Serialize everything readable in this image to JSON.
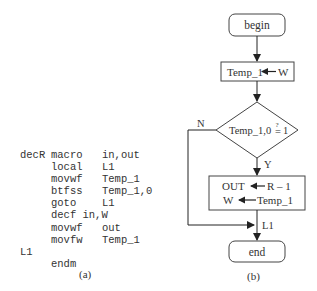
{
  "panel_a": {
    "caption": "(a)",
    "code": [
      {
        "label": "decR",
        "op": "macro",
        "args": "in,out"
      },
      {
        "label": "",
        "op": "local",
        "args": "L1"
      },
      {
        "label": "",
        "op": "movwf",
        "args": "Temp_1"
      },
      {
        "label": "",
        "op": "btfss",
        "args": "Temp_1,0"
      },
      {
        "label": "",
        "op": "goto",
        "args": "L1"
      },
      {
        "label": "",
        "op": "decf in,W",
        "args": ""
      },
      {
        "label": "",
        "op": "movwf",
        "args": "out"
      },
      {
        "label": "",
        "op": "movfw",
        "args": "Temp_1"
      },
      {
        "label": "L1",
        "op": "",
        "args": ""
      },
      {
        "label": "",
        "op": "endm",
        "args": ""
      }
    ]
  },
  "panel_b": {
    "caption": "(b)",
    "begin": "begin",
    "assign1": {
      "left": "Temp_1",
      "right": "W"
    },
    "decision": {
      "left": "Temp_1,0",
      "op": "=",
      "q": "?",
      "right": "1"
    },
    "no_label": "N",
    "yes_label": "Y",
    "assign2": {
      "line1_left": "OUT",
      "line1_right": "R – 1",
      "line2_left": "W",
      "line2_right": "Temp_1"
    },
    "join_label": "L1",
    "end": "end"
  }
}
